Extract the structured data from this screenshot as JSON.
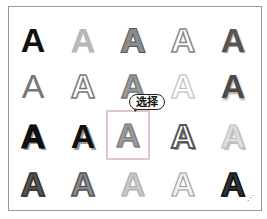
{
  "gallery": {
    "title": "WordArt style gallery",
    "rows": 4,
    "columns": 5,
    "items": [
      {
        "row": 1,
        "col": 1,
        "glyph": "A",
        "style": "s1",
        "description": "solid black"
      },
      {
        "row": 1,
        "col": 2,
        "glyph": "A",
        "style": "s2",
        "description": "light gray fill"
      },
      {
        "row": 1,
        "col": 3,
        "glyph": "A",
        "style": "s3",
        "description": "gray with dark outline"
      },
      {
        "row": 1,
        "col": 4,
        "glyph": "A",
        "style": "s4",
        "description": "white fill gray outline"
      },
      {
        "row": 1,
        "col": 5,
        "glyph": "A",
        "style": "s5",
        "description": "dark gray gradient"
      },
      {
        "row": 2,
        "col": 1,
        "glyph": "A",
        "style": "s6i",
        "description": "gray thin"
      },
      {
        "row": 2,
        "col": 2,
        "glyph": "A",
        "style": "s7",
        "description": "outline with reflection"
      },
      {
        "row": 2,
        "col": 3,
        "glyph": "A",
        "style": "s8",
        "description": "gray outlined"
      },
      {
        "row": 2,
        "col": 4,
        "glyph": "A",
        "style": "s9",
        "description": "white soft outline"
      },
      {
        "row": 2,
        "col": 5,
        "glyph": "A",
        "style": "s10",
        "description": "dark gray shadow"
      },
      {
        "row": 3,
        "col": 1,
        "glyph": "A",
        "style": "s11",
        "description": "black with shadow"
      },
      {
        "row": 3,
        "col": 2,
        "glyph": "A",
        "style": "s12",
        "description": "black offset shadow"
      },
      {
        "row": 3,
        "col": 3,
        "glyph": "A",
        "style": "s13",
        "description": "gray bevel",
        "selected": true
      },
      {
        "row": 3,
        "col": 4,
        "glyph": "A",
        "style": "s14",
        "description": "white outlined shadow"
      },
      {
        "row": 3,
        "col": 5,
        "glyph": "A",
        "style": "s15",
        "description": "light gray soft shadow"
      },
      {
        "row": 4,
        "col": 1,
        "glyph": "A",
        "style": "s16",
        "description": "dark hatched"
      },
      {
        "row": 4,
        "col": 2,
        "glyph": "A",
        "style": "s17",
        "description": "gray outlined"
      },
      {
        "row": 4,
        "col": 3,
        "glyph": "A",
        "style": "s18",
        "description": "light gray"
      },
      {
        "row": 4,
        "col": 4,
        "glyph": "A",
        "style": "s19",
        "description": "white hatched outline"
      },
      {
        "row": 4,
        "col": 5,
        "glyph": "A",
        "style": "s20",
        "description": "black hatched"
      }
    ]
  },
  "callout": {
    "label": "选择"
  },
  "resize_grip": {
    "glyph": "⋰"
  },
  "colors": {
    "border": "#9a9a9a",
    "selection": "#e3c7c7",
    "callout_border": "#222222"
  }
}
